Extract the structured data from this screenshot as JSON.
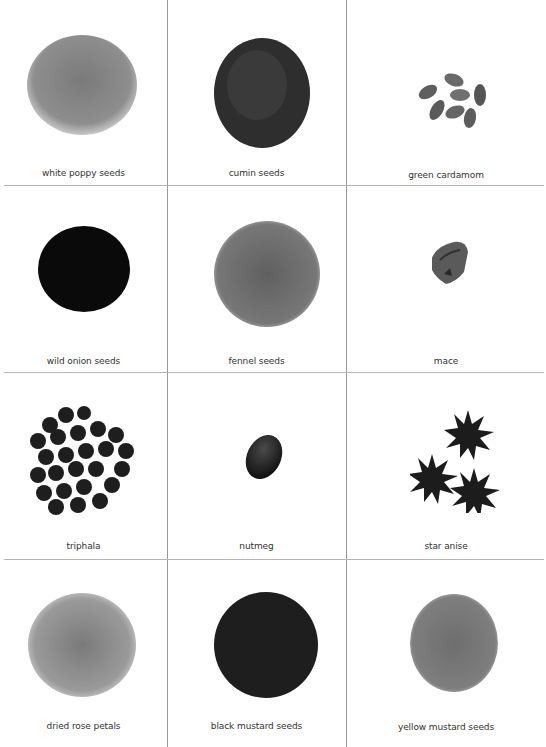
{
  "items": [
    {
      "label": "white poppy seeds",
      "icon": "white-poppy-seeds-pile",
      "tone": "#8a8a8a"
    },
    {
      "label": "cumin seeds",
      "icon": "cumin-seeds-pile",
      "tone": "#2e2e2e"
    },
    {
      "label": "green cardamom",
      "icon": "green-cardamom-pods",
      "tone": "#6a6a6a"
    },
    {
      "label": "wild onion seeds",
      "icon": "wild-onion-seeds-pile",
      "tone": "#0a0a0a"
    },
    {
      "label": "fennel seeds",
      "icon": "fennel-seeds-pile",
      "tone": "#6e6e6e"
    },
    {
      "label": "mace",
      "icon": "mace-blade",
      "tone": "#555555"
    },
    {
      "label": "triphala",
      "icon": "triphala-fruits",
      "tone": "#1e1e1e"
    },
    {
      "label": "nutmeg",
      "icon": "nutmeg-seed",
      "tone": "#1a1a1a"
    },
    {
      "label": "star anise",
      "icon": "star-anise-pods",
      "tone": "#1c1c1c"
    },
    {
      "label": "dried rose petals",
      "icon": "dried-rose-petals-pile",
      "tone": "#8c8c8c"
    },
    {
      "label": "black mustard seeds",
      "icon": "black-mustard-seeds-pile",
      "tone": "#1e1e1e"
    },
    {
      "label": "yellow mustard seeds",
      "icon": "yellow-mustard-seeds-pile",
      "tone": "#7a7a7a"
    }
  ]
}
